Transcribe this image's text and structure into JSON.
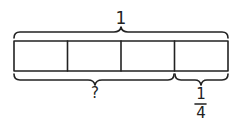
{
  "diagram": {
    "type": "tape-diagram",
    "whole_label": "1",
    "parts_count": 4,
    "unknown_label": "?",
    "part_label": {
      "numerator": "1",
      "denominator": "4"
    },
    "stroke_color": "#222222"
  }
}
